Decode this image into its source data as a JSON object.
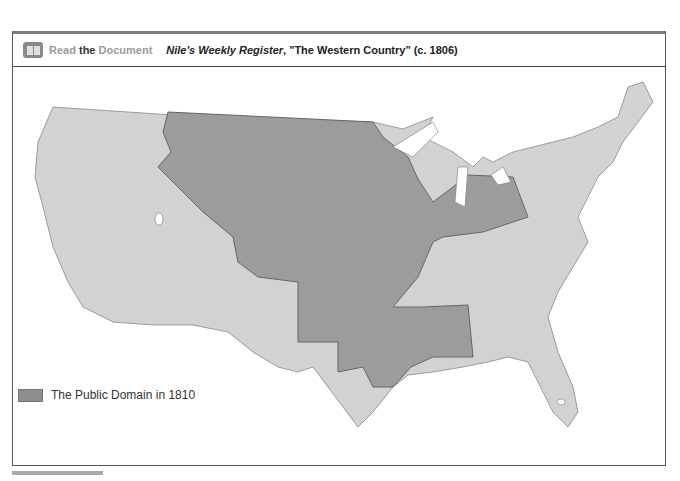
{
  "header": {
    "icon": "book-icon",
    "read_label_1": "Read",
    "read_label_2": " the ",
    "read_label_3": "Document",
    "doc_title_italic": "Nile's Weekly Register",
    "doc_title_rest": ", \"The Western Country\" (c. 1806)"
  },
  "legend": {
    "label": "The Public Domain in 1810",
    "color": "#8e8e8e"
  },
  "map": {
    "land_color": "#d2d2d2",
    "public_domain_color": "#9c9c9c",
    "water_color": "#ffffff"
  }
}
